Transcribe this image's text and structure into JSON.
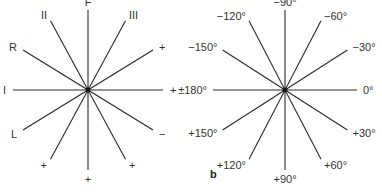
{
  "diagrams": [
    {
      "id": "left-rosette",
      "sublabel": "",
      "rays": [
        {
          "angle": -90,
          "label": "F"
        },
        {
          "angle": -60,
          "label": "III"
        },
        {
          "angle": -30,
          "label": "+"
        },
        {
          "angle": 0,
          "label": "+"
        },
        {
          "angle": 30,
          "label": "−"
        },
        {
          "angle": 60,
          "label": "+"
        },
        {
          "angle": 90,
          "label": "+"
        },
        {
          "angle": 120,
          "label": "+"
        },
        {
          "angle": 150,
          "label": "L"
        },
        {
          "angle": 180,
          "label": "I"
        },
        {
          "angle": -150,
          "label": "R"
        },
        {
          "angle": -120,
          "label": "II"
        }
      ]
    },
    {
      "id": "right-rosette",
      "sublabel": "b",
      "rays": [
        {
          "angle": -90,
          "label": "−90°"
        },
        {
          "angle": -60,
          "label": "−60°"
        },
        {
          "angle": -30,
          "label": "−30°"
        },
        {
          "angle": 0,
          "label": "0°"
        },
        {
          "angle": 30,
          "label": "+30°"
        },
        {
          "angle": 60,
          "label": "+60°"
        },
        {
          "angle": 90,
          "label": "+90°"
        },
        {
          "angle": 120,
          "label": "+120°"
        },
        {
          "angle": 150,
          "label": "+150°"
        },
        {
          "angle": 180,
          "label": "±180°"
        },
        {
          "angle": -150,
          "label": "−150°"
        },
        {
          "angle": -120,
          "label": "−120°"
        }
      ]
    }
  ]
}
